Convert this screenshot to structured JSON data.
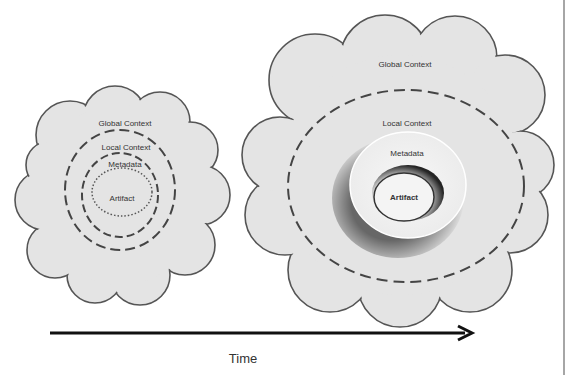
{
  "diagram": {
    "small_cloud": {
      "global_label": "Global Context",
      "local_label": "Local Context",
      "metadata_label": "Metadata",
      "artifact_label": "Artifact"
    },
    "large_cloud": {
      "global_label": "Global Context",
      "local_label": "Local Context",
      "metadata_label": "Metadata",
      "artifact_label": "Artifact"
    },
    "axis": {
      "label": "Time",
      "icon": "arrow-right-icon"
    },
    "colors": {
      "cloud_fill": "#e4e4e4",
      "cloud_stroke": "#555555",
      "text": "#333333",
      "arrow": "#111111",
      "frame_line": "#888888"
    }
  }
}
